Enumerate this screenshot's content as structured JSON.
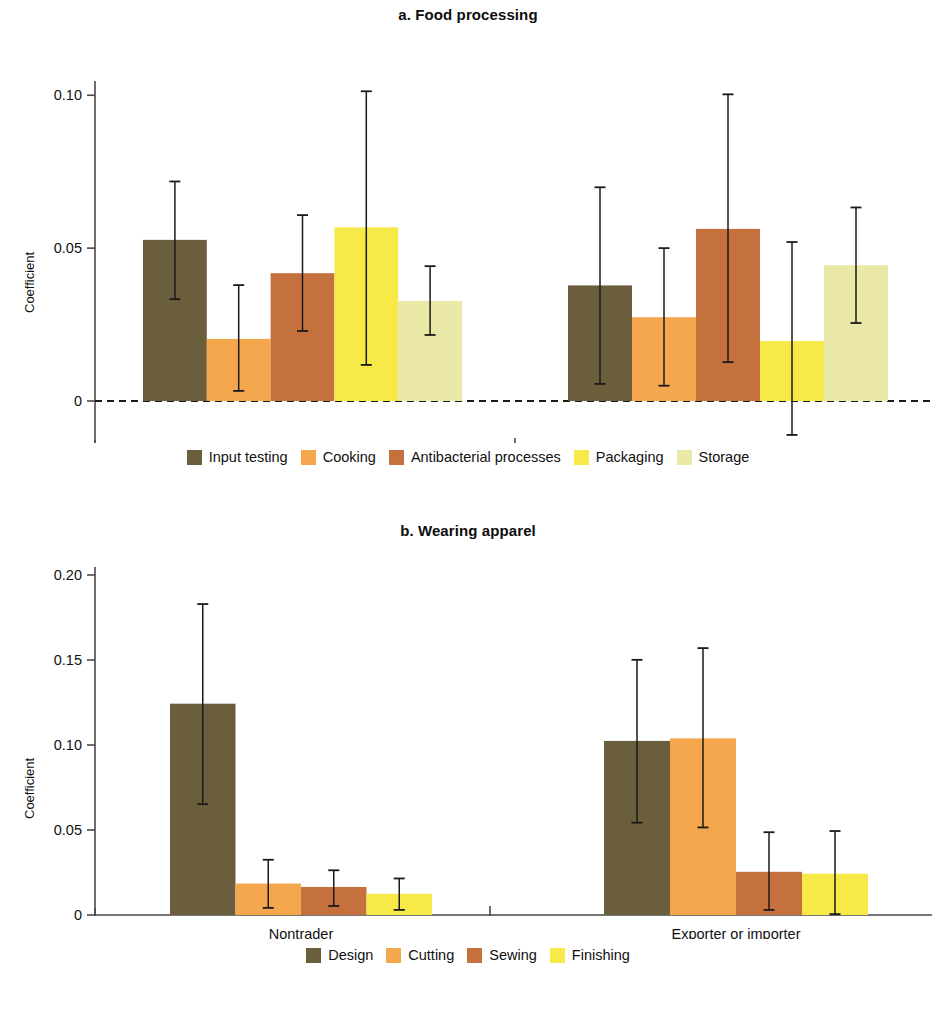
{
  "figure": {
    "panels": [
      {
        "key": "a",
        "title": "a. Food processing",
        "ylabel": "Coefficient"
      },
      {
        "key": "b",
        "title": "b. Wearing apparel",
        "ylabel": "Coefficient"
      }
    ]
  },
  "panel_a": {
    "title": "a. Food processing",
    "ylabel": "Coefficient",
    "yticks": [
      "0.10",
      "0.05",
      "0"
    ],
    "categories": [
      "Nontrader",
      "Exporter or importer"
    ],
    "legend": [
      {
        "label": "Input testing",
        "color": "#6b5e3d"
      },
      {
        "label": "Cooking",
        "color": "#f5a74e"
      },
      {
        "label": "Antibacterial processes",
        "color": "#c4713d"
      },
      {
        "label": "Packaging",
        "color": "#f7e948"
      },
      {
        "label": "Storage",
        "color": "#e9e8a6"
      }
    ]
  },
  "panel_b": {
    "title": "b. Wearing apparel",
    "ylabel": "Coefficient",
    "yticks": [
      "0.20",
      "0.15",
      "0.10",
      "0.05",
      "0"
    ],
    "categories": [
      "Nontrader",
      "Exporter or importer"
    ],
    "legend": [
      {
        "label": "Design",
        "color": "#6b5e3d"
      },
      {
        "label": "Cutting",
        "color": "#f5a74e"
      },
      {
        "label": "Sewing",
        "color": "#c4713d"
      },
      {
        "label": "Finishing",
        "color": "#f7e948"
      }
    ]
  },
  "chart_data": [
    {
      "type": "bar",
      "panel": "a",
      "title": "a. Food processing",
      "xlabel": "",
      "ylabel": "Coefficient",
      "ylim": [
        -0.018,
        0.108
      ],
      "ytick_values": [
        0.1,
        0.05,
        0
      ],
      "ytick_labels": [
        "0.10",
        "0.05",
        "0"
      ],
      "grid": false,
      "legend_position": "bottom",
      "categories": [
        "Nontrader",
        "Exporter or importer"
      ],
      "error_bars": "confidence interval",
      "series": [
        {
          "name": "Input testing",
          "color": "#6b5e3d",
          "values": [
            0.0527,
            0.0378
          ],
          "ci_low": [
            0.0333,
            0.0056
          ],
          "ci_high": [
            0.0718,
            0.0699
          ]
        },
        {
          "name": "Cooking",
          "color": "#f5a74e",
          "values": [
            0.0203,
            0.0274
          ],
          "ci_low": [
            0.0033,
            0.005
          ],
          "ci_high": [
            0.0379,
            0.05
          ]
        },
        {
          "name": "Antibacterial processes",
          "color": "#c4713d",
          "values": [
            0.0418,
            0.0563
          ],
          "ci_low": [
            0.0229,
            0.0127
          ],
          "ci_high": [
            0.0608,
            0.1003
          ]
        },
        {
          "name": "Packaging",
          "color": "#f7e948",
          "values": [
            0.0568,
            0.0196
          ],
          "ci_low": [
            0.0118,
            -0.0111
          ],
          "ci_high": [
            0.1013,
            0.052
          ]
        },
        {
          "name": "Storage",
          "color": "#e9e8a6",
          "values": [
            0.0327,
            0.0444
          ],
          "ci_low": [
            0.0216,
            0.0255
          ],
          "ci_high": [
            0.0441,
            0.0633
          ]
        }
      ]
    },
    {
      "type": "bar",
      "panel": "b",
      "title": "b. Wearing apparel",
      "xlabel": "",
      "ylabel": "Coefficient",
      "ylim": [
        0,
        0.205
      ],
      "ytick_values": [
        0.2,
        0.15,
        0.1,
        0.05,
        0
      ],
      "ytick_labels": [
        "0.20",
        "0.15",
        "0.10",
        "0.05",
        "0"
      ],
      "grid": false,
      "legend_position": "bottom",
      "categories": [
        "Nontrader",
        "Exporter or importer"
      ],
      "error_bars": "confidence interval",
      "series": [
        {
          "name": "Design",
          "color": "#6b5e3d",
          "values": [
            0.1243,
            0.1024
          ],
          "ci_low": [
            0.0652,
            0.0543
          ],
          "ci_high": [
            0.1829,
            0.1501
          ]
        },
        {
          "name": "Cutting",
          "color": "#f5a74e",
          "values": [
            0.0185,
            0.1039
          ],
          "ci_low": [
            0.0042,
            0.0515
          ],
          "ci_high": [
            0.0325,
            0.157
          ]
        },
        {
          "name": "Sewing",
          "color": "#c4713d",
          "values": [
            0.0165,
            0.0254
          ],
          "ci_low": [
            0.0053,
            0.003
          ],
          "ci_high": [
            0.0263,
            0.0487
          ]
        },
        {
          "name": "Finishing",
          "color": "#f7e948",
          "values": [
            0.0125,
            0.0243
          ],
          "ci_low": [
            0.003,
            0.0005
          ],
          "ci_high": [
            0.0215,
            0.0494
          ]
        }
      ]
    }
  ]
}
